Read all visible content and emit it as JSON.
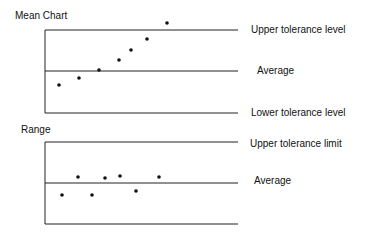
{
  "chart_data": [
    {
      "type": "scatter",
      "title": "Mean Chart",
      "reference_lines": [
        {
          "name": "Upper tolerance level",
          "y": 30
        },
        {
          "name": "Average",
          "y": 71
        },
        {
          "name": "Lower tolerance level",
          "y": 113
        }
      ],
      "points": [
        [
          59,
          85
        ],
        [
          79,
          78
        ],
        [
          99,
          70
        ],
        [
          119,
          60
        ],
        [
          131,
          50
        ],
        [
          147,
          39
        ],
        [
          167,
          23
        ]
      ],
      "xlabel": "",
      "ylabel": "",
      "grid": false
    },
    {
      "type": "scatter",
      "title": "Range",
      "reference_lines": [
        {
          "name": "Upper tolerance limit",
          "y": 142
        },
        {
          "name": "Average",
          "y": 183
        },
        {
          "name": "",
          "y": 224
        }
      ],
      "points": [
        [
          62,
          195
        ],
        [
          78,
          177
        ],
        [
          92,
          195
        ],
        [
          105,
          178
        ],
        [
          120,
          176
        ],
        [
          136,
          191
        ],
        [
          159,
          177
        ]
      ],
      "xlabel": "",
      "ylabel": "",
      "grid": false
    }
  ],
  "labels": {
    "mean_title": "Mean Chart",
    "mean_upper": "Upper tolerance level",
    "mean_average": "Average",
    "mean_lower": "Lower tolerance level",
    "range_title": "Range",
    "range_upper": "Upper tolerance limit",
    "range_average": "Average"
  }
}
